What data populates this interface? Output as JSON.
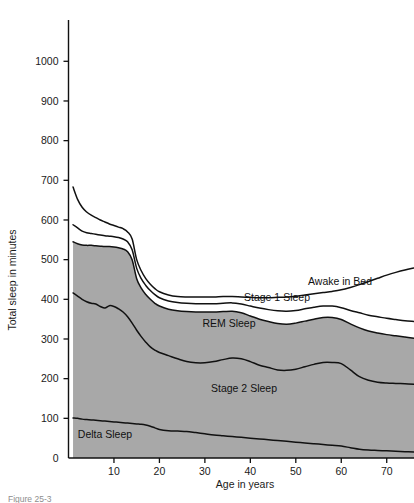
{
  "chart_data": {
    "type": "area",
    "title": "",
    "xlabel": "Age in years",
    "ylabel": "Total sleep in minutes",
    "xlim": [
      0,
      76
    ],
    "ylim": [
      0,
      1060
    ],
    "grid": false,
    "legend_position": "inline-labels",
    "stacked": true,
    "fill_color": "#a8a8a8",
    "line_color": "#111111",
    "background": "#ffffff",
    "x_ticks": [
      10,
      20,
      30,
      40,
      50,
      60,
      70
    ],
    "y_ticks": [
      0,
      100,
      200,
      300,
      400,
      500,
      600,
      700,
      800,
      900,
      1000
    ],
    "x": [
      1,
      2,
      3,
      4,
      5,
      6,
      7,
      8,
      9,
      10,
      11,
      12,
      13,
      14,
      15,
      16,
      17,
      18,
      19,
      20,
      22,
      24,
      26,
      28,
      30,
      32,
      34,
      36,
      38,
      40,
      42,
      44,
      46,
      48,
      50,
      52,
      54,
      56,
      58,
      60,
      62,
      64,
      66,
      68,
      70,
      72,
      74,
      76
    ],
    "series": [
      {
        "name": "Delta Sleep",
        "label": "Delta Sleep",
        "cumulative_top": [
          101,
          100,
          98,
          97,
          96,
          95,
          94,
          93,
          92,
          91,
          90,
          89,
          88,
          87,
          86,
          85,
          83,
          80,
          76,
          72,
          69,
          68,
          67,
          64,
          61,
          58,
          56,
          54,
          52,
          50,
          48,
          46,
          44,
          42,
          40,
          38,
          36,
          34,
          32,
          30,
          26,
          22,
          20,
          19,
          18,
          17,
          16,
          15
        ]
      },
      {
        "name": "Stage 2 Sleep",
        "label": "Stage 2 Sleep",
        "cumulative_top": [
          416,
          408,
          400,
          394,
          390,
          388,
          382,
          378,
          384,
          382,
          376,
          368,
          356,
          340,
          322,
          306,
          292,
          280,
          272,
          266,
          258,
          250,
          243,
          240,
          240,
          243,
          248,
          252,
          250,
          243,
          234,
          228,
          222,
          221,
          224,
          230,
          236,
          241,
          241,
          238,
          222,
          205,
          196,
          191,
          189,
          188,
          187,
          186
        ]
      },
      {
        "name": "REM Sleep",
        "label": "REM Sleep",
        "cumulative_top": [
          545,
          540,
          537,
          536,
          536,
          535,
          534,
          533,
          533,
          532,
          530,
          527,
          520,
          500,
          452,
          428,
          412,
          400,
          390,
          383,
          375,
          371,
          369,
          368,
          368,
          368,
          369,
          370,
          366,
          358,
          350,
          344,
          339,
          337,
          340,
          345,
          350,
          354,
          354,
          349,
          338,
          328,
          320,
          315,
          311,
          308,
          305,
          302
        ]
      },
      {
        "name": "Stage 1 Sleep",
        "label": "Stage 1 Sleep",
        "cumulative_top": [
          588,
          580,
          572,
          568,
          566,
          564,
          562,
          560,
          559,
          558,
          556,
          552,
          545,
          525,
          478,
          452,
          435,
          422,
          412,
          404,
          396,
          392,
          390,
          389,
          389,
          389,
          390,
          391,
          388,
          383,
          378,
          374,
          371,
          370,
          372,
          376,
          380,
          383,
          383,
          379,
          372,
          366,
          360,
          356,
          352,
          349,
          346,
          344
        ]
      },
      {
        "name": "Awake in Bed",
        "label": "Awake in Bed",
        "cumulative_top": [
          683,
          652,
          632,
          620,
          612,
          606,
          600,
          595,
          590,
          586,
          582,
          578,
          570,
          552,
          500,
          472,
          452,
          438,
          427,
          419,
          411,
          407,
          406,
          406,
          406,
          406,
          407,
          407,
          406,
          405,
          404,
          404,
          405,
          406,
          408,
          411,
          414,
          417,
          420,
          424,
          430,
          437,
          445,
          453,
          461,
          468,
          474,
          479
        ]
      }
    ]
  },
  "axes": {
    "y_title": "Total sleep in minutes",
    "x_title": "Age in years",
    "y_tick_labels": [
      "0",
      "100",
      "200",
      "300",
      "400",
      "500",
      "600",
      "700",
      "800",
      "900",
      "1000"
    ],
    "x_tick_labels": [
      "10",
      "20",
      "30",
      "40",
      "50",
      "60",
      "70"
    ]
  },
  "band_labels": [
    {
      "text": "Awake in Bed",
      "x": 340,
      "y": 285
    },
    {
      "text": "Stage 1 Sleep",
      "x": 277,
      "y": 301
    },
    {
      "text": "REM Sleep",
      "x": 229,
      "y": 327
    },
    {
      "text": "Stage 2 Sleep",
      "x": 244,
      "y": 392
    },
    {
      "text": "Delta Sleep",
      "x": 105,
      "y": 438
    }
  ],
  "caption": {
    "prefix": "Figure",
    "number": "25-3",
    "text": ""
  }
}
